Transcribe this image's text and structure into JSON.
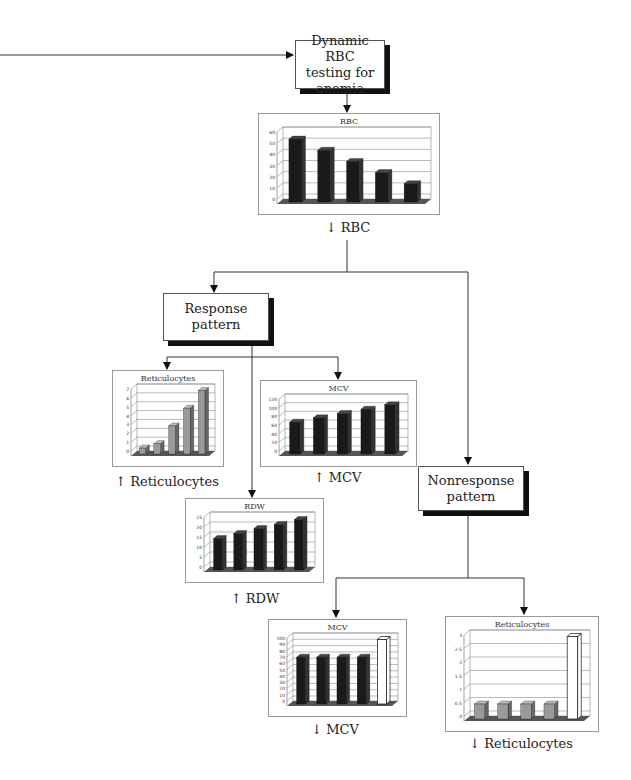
{
  "nodes": {
    "top": {
      "line1": "Dynamic RBC",
      "line2": "testing for anemia"
    },
    "response": {
      "line1": "Response",
      "line2": "pattern"
    },
    "nonresponse": {
      "line1": "Nonresponse",
      "line2": "pattern"
    }
  },
  "captions": {
    "rbc": "↓ RBC",
    "retic_up": "↑ Reticulocytes",
    "mcv_up": "↑ MCV",
    "rdw_up": "↑ RDW",
    "mcv_down": "↓ MCV",
    "retic_down": "↓ Reticulocytes"
  },
  "chart_data": [
    {
      "id": "rbc",
      "type": "bar",
      "title": "RBC",
      "categories": [
        "1",
        "2",
        "3",
        "4",
        "5"
      ],
      "values": [
        55,
        45,
        35,
        25,
        15
      ],
      "ylim": [
        0,
        60
      ],
      "yticks": [
        0,
        10,
        20,
        30,
        40,
        50,
        60
      ],
      "bar_style": [
        "dark",
        "dark",
        "dark",
        "dark",
        "dark"
      ]
    },
    {
      "id": "retic_up",
      "type": "bar",
      "title": "Reticulocytes",
      "categories": [
        "1",
        "2",
        "3",
        "4",
        "5"
      ],
      "values": [
        0.5,
        1,
        3,
        5,
        7
      ],
      "ylim": [
        0,
        7
      ],
      "yticks": [
        0,
        1,
        2,
        3,
        4,
        5,
        6,
        7
      ],
      "bar_style": [
        "gray",
        "gray",
        "gray",
        "gray",
        "gray"
      ]
    },
    {
      "id": "mcv_up",
      "type": "bar",
      "title": "MCV",
      "categories": [
        "1",
        "2",
        "3",
        "4",
        "5"
      ],
      "values": [
        70,
        80,
        90,
        100,
        110
      ],
      "ylim": [
        0,
        120
      ],
      "yticks": [
        0,
        20,
        40,
        60,
        80,
        100,
        120
      ],
      "bar_style": [
        "dark",
        "dark",
        "dark",
        "dark",
        "dark"
      ]
    },
    {
      "id": "rdw_up",
      "type": "bar",
      "title": "RDW",
      "categories": [
        "1",
        "2",
        "3",
        "4",
        "5"
      ],
      "values": [
        15,
        17.5,
        20,
        22,
        24.5
      ],
      "ylim": [
        0,
        25
      ],
      "yticks": [
        0,
        5,
        10,
        15,
        20,
        25
      ],
      "bar_style": [
        "dark",
        "dark",
        "dark",
        "dark",
        "dark"
      ]
    },
    {
      "id": "mcv_down",
      "type": "bar",
      "title": "MCV",
      "categories": [
        "1",
        "2",
        "3",
        "4",
        "5"
      ],
      "values": [
        72,
        72,
        72,
        72,
        100
      ],
      "ylim": [
        0,
        100
      ],
      "yticks": [
        0,
        10,
        20,
        30,
        40,
        50,
        60,
        70,
        80,
        90,
        100
      ],
      "bar_style": [
        "dark",
        "dark",
        "dark",
        "dark",
        "outline"
      ]
    },
    {
      "id": "retic_down",
      "type": "bar",
      "title": "Reticulocytes",
      "categories": [
        "1",
        "2",
        "3",
        "4",
        "5"
      ],
      "values": [
        0.5,
        0.5,
        0.5,
        0.5,
        3
      ],
      "ylim": [
        0,
        3
      ],
      "yticks": [
        0,
        0.5,
        1,
        1.5,
        2,
        2.5,
        3
      ],
      "bar_style": [
        "gray",
        "gray",
        "gray",
        "gray",
        "outline"
      ]
    }
  ]
}
